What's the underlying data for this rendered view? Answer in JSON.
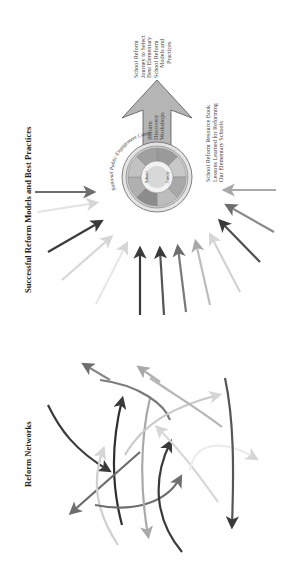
{
  "diagram": {
    "orientation": "rotated -90deg (text reads bottom-to-top)",
    "top_section": {
      "title": "Successful Reform Models and Best Practices",
      "hub": {
        "outer_ring_label": "National Public Engagement Campaign",
        "inner_labels": [
          "School",
          "Family"
        ],
        "ring_segments": 8
      },
      "output_arrow": {
        "label_lines": [
          "Reform",
          "Discovery",
          "Workshops"
        ]
      },
      "journey_note": {
        "lines": [
          "School Reform",
          "Journey to Select",
          "Best Elementary",
          "School Reform",
          "Models and",
          "Practices"
        ]
      },
      "resource_note": {
        "lines": [
          "School Reform Resource Book",
          "Lessons Learned for Reforming",
          "Our Elementary Schools"
        ]
      },
      "incoming_arrow_count": 12
    },
    "bottom_section": {
      "title": "Reform Networks",
      "network_arrow_count": 12
    },
    "colors": {
      "dark": "#3a3a3a",
      "mid": "#6e6e6e",
      "light": "#a9a9a9",
      "pale": "#d6d6d6",
      "arrow_fill": "#b5b5b5"
    }
  }
}
